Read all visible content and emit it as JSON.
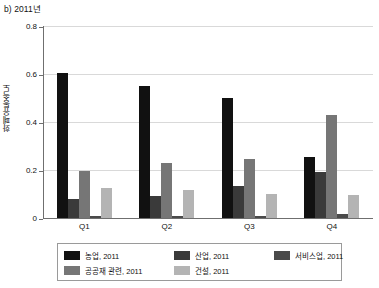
{
  "chart_data": {
    "type": "bar",
    "title": "b) 2011년",
    "xlabel": "",
    "ylabel": "화폐유통속도",
    "ylim": [
      0,
      0.8
    ],
    "yticks": [
      "0",
      "0.2",
      "0.4",
      "0.6",
      "0.8"
    ],
    "ytick_values": [
      0,
      0.2,
      0.4,
      0.6,
      0.8
    ],
    "grid": true,
    "legend_position": "below-plot",
    "categories": [
      "Q1",
      "Q2",
      "Q3",
      "Q4"
    ],
    "series": [
      {
        "name": "농업, 2011",
        "color": "#111111",
        "values": [
          0.605,
          0.55,
          0.5,
          0.255
        ]
      },
      {
        "name": "산업, 2011",
        "color": "#3a3a3a",
        "values": [
          0.08,
          0.09,
          0.135,
          0.19
        ]
      },
      {
        "name": "공공재 관련, 2011",
        "color": "#767676",
        "values": [
          0.195,
          0.23,
          0.245,
          0.43
        ]
      },
      {
        "name": "서비스업, 2011",
        "color": "#4a4a4a",
        "values": [
          0.008,
          0.008,
          0.01,
          0.015
        ]
      },
      {
        "name": "건설, 2011",
        "color": "#b4b4b4",
        "values": [
          0.125,
          0.115,
          0.1,
          0.095
        ]
      }
    ]
  },
  "legend": {
    "entries": [
      {
        "label": "농업, 2011",
        "color": "#111111"
      },
      {
        "label": "산업, 2011",
        "color": "#3a3a3a"
      },
      {
        "label": "서비스업, 2011",
        "color": "#4a4a4a"
      },
      {
        "label": "공공재 관련, 2011",
        "color": "#767676"
      },
      {
        "label": "건설, 2011",
        "color": "#b4b4b4"
      }
    ]
  }
}
